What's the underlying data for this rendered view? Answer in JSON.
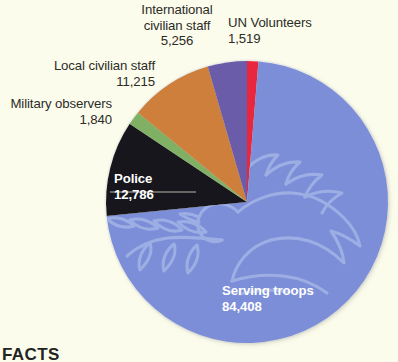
{
  "background_color": "#fcfcec",
  "footer": {
    "text": "FACTS"
  },
  "chart_data": {
    "type": "pie",
    "title": "",
    "subtitle": "",
    "xlabel": "",
    "ylabel": "",
    "legend_position": "callout-labels",
    "grid": false,
    "total": 117024,
    "center": {
      "x": 247,
      "y": 202,
      "radius": 141
    },
    "start_angle_deg": 0,
    "direction": "clockwise",
    "categories": [
      "UN Volunteers",
      "Serving troops",
      "Police",
      "Military observers",
      "Local civilian staff",
      "International civilian staff"
    ],
    "values": [
      1519,
      84408,
      12786,
      1840,
      11215,
      5256
    ],
    "value_labels": [
      "1,519",
      "84,408",
      "12,786",
      "1,840",
      "11,215",
      "5,256"
    ],
    "colors": [
      "#e8253c",
      "#7b8ed8",
      "#14141e",
      "#7fb063",
      "#cd7f3a",
      "#6b5ba8"
    ],
    "slices": [
      {
        "name": "UN Volunteers",
        "value": 1519,
        "value_label": "1,519",
        "color": "#e8253c",
        "label_text": "UN Volunteers",
        "label_placement": "outside",
        "label_align": "left"
      },
      {
        "name": "Serving troops",
        "value": 84408,
        "value_label": "84,408",
        "color": "#7b8ed8",
        "label_text": "Serving troops",
        "label_placement": "inside",
        "label_align": "left"
      },
      {
        "name": "Police",
        "value": 12786,
        "value_label": "12,786",
        "color": "#14141e",
        "label_text": "Police",
        "label_placement": "inside",
        "label_align": "left"
      },
      {
        "name": "Military observers",
        "value": 1840,
        "value_label": "1,840",
        "color": "#7fb063",
        "label_text": "Military observers",
        "label_placement": "outside",
        "label_align": "right"
      },
      {
        "name": "Local civilian staff",
        "value": 11215,
        "value_label": "11,215",
        "color": "#cd7f3a",
        "label_text": "Local civilian staff",
        "label_placement": "outside",
        "label_align": "right"
      },
      {
        "name": "International civilian staff",
        "value": 5256,
        "value_label": "5,256",
        "color": "#6b5ba8",
        "label_text_line1": "International",
        "label_text_line2": "civilian staff",
        "label_placement": "outside",
        "label_align": "right"
      }
    ],
    "watermark": "dove-with-olive-branch"
  },
  "labels": {
    "international_civilian_staff": {
      "line1": "International",
      "line2": "civilian staff",
      "value": "5,256"
    },
    "un_volunteers": {
      "line1": "UN Volunteers",
      "value": "1,519"
    },
    "local_civilian_staff": {
      "line1": "Local civilian staff",
      "value": "11,215"
    },
    "military_observers": {
      "line1": "Military observers",
      "value": "1,840"
    },
    "police": {
      "line1": "Police",
      "value": "12,786"
    },
    "serving_troops": {
      "line1": "Serving troops",
      "value": "84,408"
    }
  }
}
